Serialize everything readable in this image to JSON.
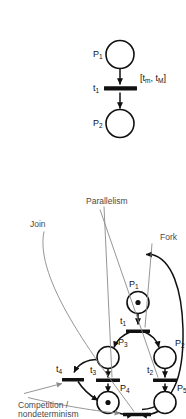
{
  "figure": {
    "background_color": "#ffffff",
    "ink_color": "#111111",
    "annotation_color": "#4a4a4a",
    "orientation": "rotated-90-ccw"
  },
  "top_net": {
    "title": "Petri net with fork, parallelism, competition and join",
    "places": [
      {
        "id": "P1",
        "label": "P",
        "sub": "1",
        "tokens": 1
      },
      {
        "id": "P2",
        "label": "P",
        "sub": "2",
        "tokens": 0
      },
      {
        "id": "P3",
        "label": "P",
        "sub": "3",
        "tokens": 0
      },
      {
        "id": "P4",
        "label": "P",
        "sub": "4",
        "tokens": 1
      },
      {
        "id": "P5",
        "label": "P",
        "sub": "5",
        "tokens": 0
      }
    ],
    "transitions": [
      {
        "id": "t1",
        "label": "t",
        "sub": "1"
      },
      {
        "id": "t2",
        "label": "t",
        "sub": "2"
      },
      {
        "id": "t3",
        "label": "t",
        "sub": "3"
      },
      {
        "id": "t4",
        "label": "t",
        "sub": "4"
      },
      {
        "id": "tjoin",
        "label": "",
        "sub": ""
      }
    ],
    "annotations": [
      {
        "id": "competition",
        "line1": "Competition /",
        "line2": "nondeterminism"
      },
      {
        "id": "fork",
        "text": "Fork"
      },
      {
        "id": "join",
        "text": "Join"
      },
      {
        "id": "parallelism",
        "text": "Parallelism"
      }
    ]
  },
  "bottom_net": {
    "title": "Single timed transition",
    "places": [
      {
        "id": "P1",
        "label": "P",
        "sub": "1",
        "tokens": 0
      },
      {
        "id": "P2",
        "label": "P",
        "sub": "2",
        "tokens": 0
      }
    ],
    "transitions": [
      {
        "id": "t1",
        "label": "t",
        "sub": "1"
      }
    ],
    "interval": {
      "open": "[",
      "min": "t",
      "min_sub": "m",
      "sep": ", ",
      "max": "t",
      "max_sub": "M",
      "close": "]"
    }
  }
}
